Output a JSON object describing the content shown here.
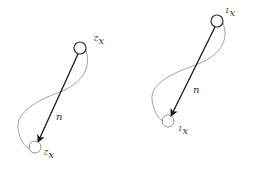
{
  "diagram": {
    "panels": [
      {
        "id": "left",
        "top_node": {
          "label": "x",
          "subscript": "2",
          "cx": 80,
          "cy": 48,
          "r": 6
        },
        "bottom_node": {
          "label": "x",
          "subscript": "2",
          "cx": 35,
          "cy": 147,
          "r": 6
        },
        "arrow_label": "n",
        "label_orientation": "rotated-180"
      },
      {
        "id": "right",
        "top_node": {
          "label": "x",
          "subscript": "1",
          "cx": 217,
          "cy": 21,
          "r": 6
        },
        "bottom_node": {
          "label": "x",
          "subscript": "1",
          "cx": 168,
          "cy": 121,
          "r": 6
        },
        "arrow_label": "n",
        "label_orientation": "rotated-180"
      }
    ],
    "colors": {
      "arrow": "#1a1a1a",
      "curve": "#999999",
      "top_node_stroke": "#333333",
      "bottom_node_stroke": "#888888",
      "text": "#333333"
    }
  }
}
